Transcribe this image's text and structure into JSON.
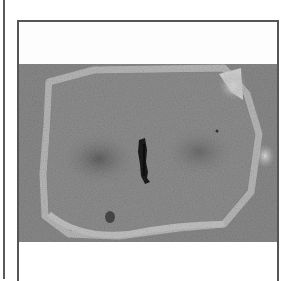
{
  "figure": {
    "header_text": "",
    "caption_text": "",
    "image": {
      "subject": "micrograph-cell-metaphase",
      "colors": {
        "background_tissue": "#878787",
        "cell_boundary": "#b9b9b9",
        "cytoplasm": "#8e8e8e",
        "spindle_shadow": "#6e6e6e",
        "chromosome_plate": "#1e1e1e",
        "light_patch": "#d4d4d4"
      }
    }
  },
  "frame": {
    "border_color": "#555555",
    "outer_rule_color": "#5a5a5a"
  }
}
